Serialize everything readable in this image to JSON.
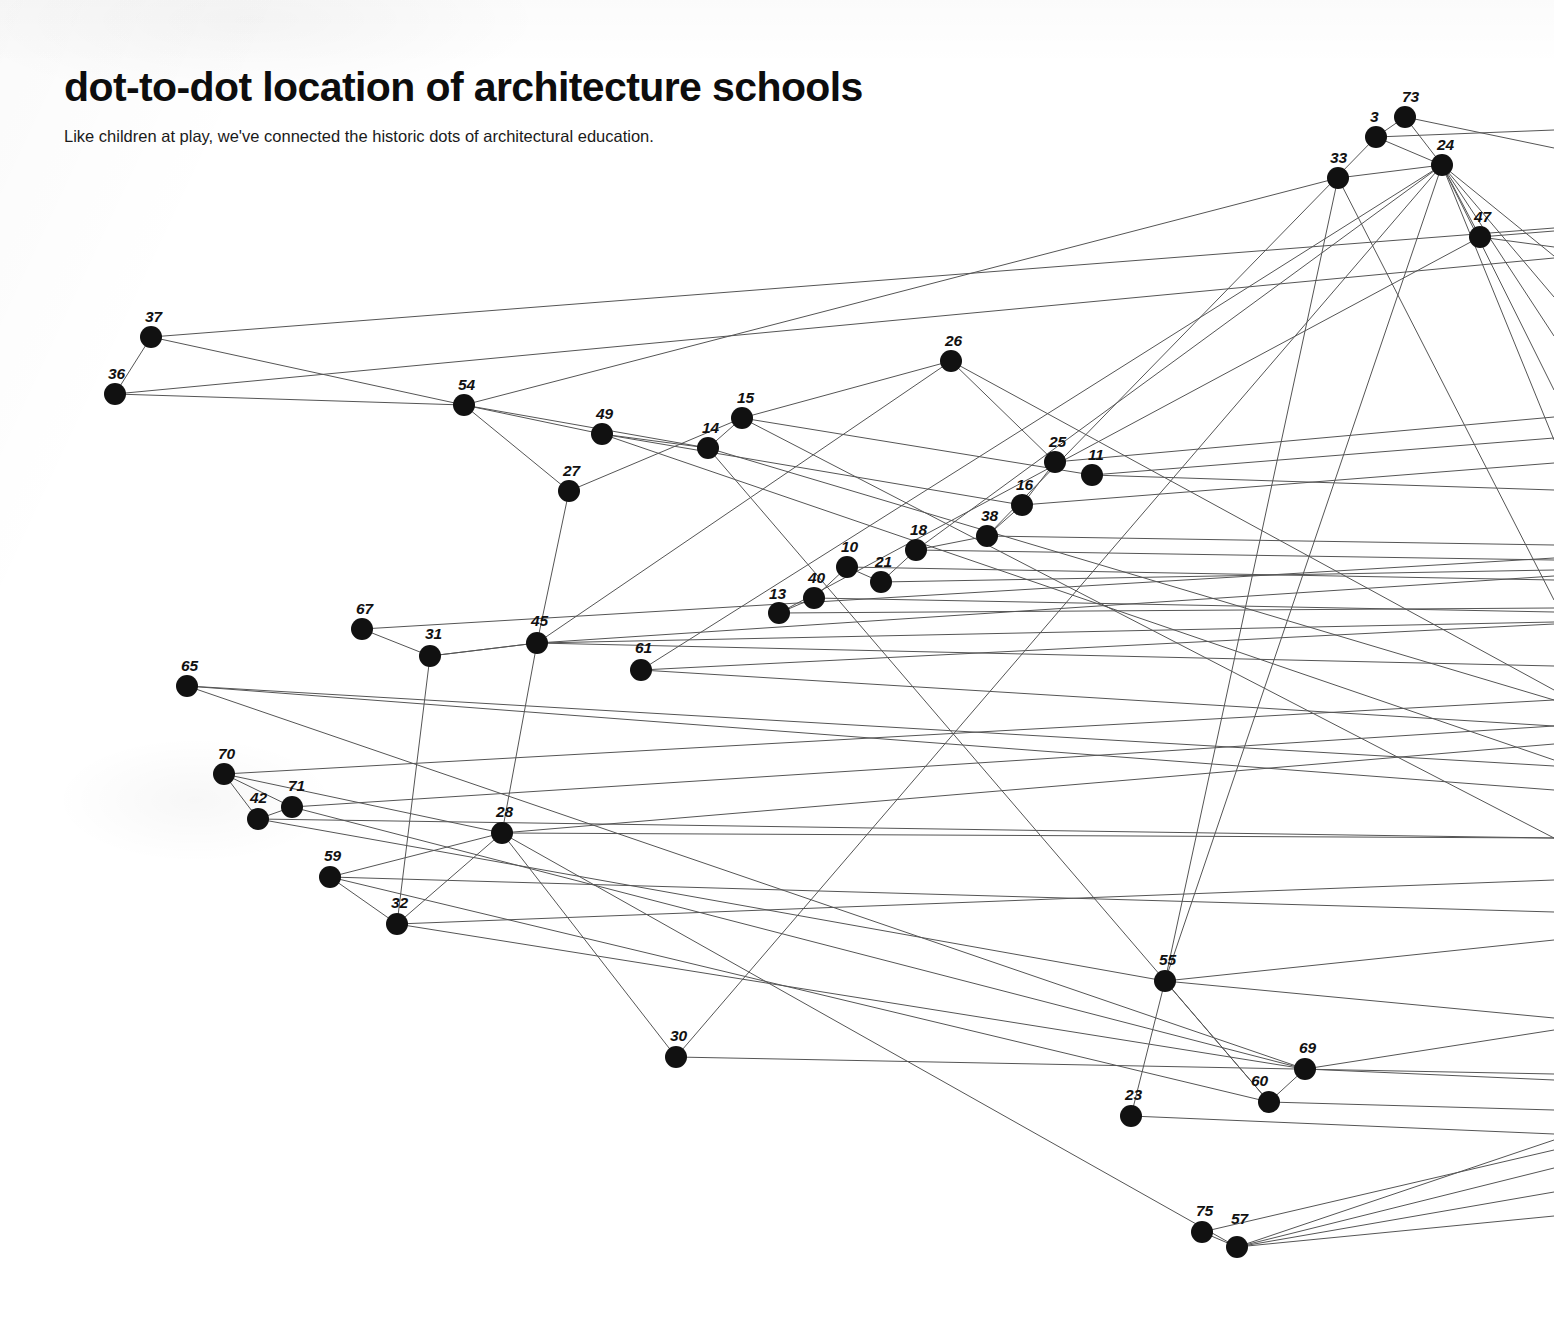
{
  "header": {
    "title": "dot-to-dot location of architecture schools",
    "subtitle": "Like children at play, we've connected the historic dots of architectural education."
  },
  "style": {
    "background": "#ffffff",
    "node_color": "#111111",
    "edge_color": "#555555",
    "text_color": "#0d0d0d",
    "node_radius": 11,
    "edge_width": 1
  },
  "chart_data": {
    "type": "scatter",
    "title": "dot-to-dot location of architecture schools",
    "subtitle": "Like children at play, we've connected the historic dots of architectural education.",
    "xlabel": "",
    "ylabel": "",
    "xlim": [
      0,
      1554
    ],
    "ylim": [
      0,
      1322
    ],
    "grid": false,
    "legend": null,
    "note": "Node-link diagram on a scanned page; numbered dots connected by thin straight lines, many of which continue past the right page edge.",
    "nodes": [
      {
        "id": "3",
        "x": 1376,
        "y": 137,
        "label_dx": -6,
        "label_dy": -20
      },
      {
        "id": "73",
        "x": 1405,
        "y": 117,
        "label_dx": -3,
        "label_dy": -20
      },
      {
        "id": "24",
        "x": 1442,
        "y": 165,
        "label_dx": -5,
        "label_dy": -20
      },
      {
        "id": "33",
        "x": 1338,
        "y": 178,
        "label_dx": -8,
        "label_dy": -20
      },
      {
        "id": "47",
        "x": 1480,
        "y": 237,
        "label_dx": -6,
        "label_dy": -20
      },
      {
        "id": "37",
        "x": 151,
        "y": 337,
        "label_dx": -6,
        "label_dy": -20
      },
      {
        "id": "36",
        "x": 115,
        "y": 394,
        "label_dx": -7,
        "label_dy": -20
      },
      {
        "id": "26",
        "x": 951,
        "y": 361,
        "label_dx": -6,
        "label_dy": -20
      },
      {
        "id": "54",
        "x": 464,
        "y": 405,
        "label_dx": -6,
        "label_dy": -20
      },
      {
        "id": "49",
        "x": 602,
        "y": 434,
        "label_dx": -6,
        "label_dy": -20
      },
      {
        "id": "15",
        "x": 742,
        "y": 418,
        "label_dx": -5,
        "label_dy": -20
      },
      {
        "id": "14",
        "x": 708,
        "y": 448,
        "label_dx": -6,
        "label_dy": -20
      },
      {
        "id": "25",
        "x": 1055,
        "y": 462,
        "label_dx": -6,
        "label_dy": -20
      },
      {
        "id": "11",
        "x": 1092,
        "y": 475,
        "label_dx": -4,
        "label_dy": -20
      },
      {
        "id": "27",
        "x": 569,
        "y": 491,
        "label_dx": -6,
        "label_dy": -20
      },
      {
        "id": "16",
        "x": 1022,
        "y": 505,
        "label_dx": -6,
        "label_dy": -20
      },
      {
        "id": "38",
        "x": 987,
        "y": 536,
        "label_dx": -6,
        "label_dy": -20
      },
      {
        "id": "18",
        "x": 916,
        "y": 550,
        "label_dx": -6,
        "label_dy": -20
      },
      {
        "id": "10",
        "x": 847,
        "y": 567,
        "label_dx": -6,
        "label_dy": -20
      },
      {
        "id": "21",
        "x": 881,
        "y": 582,
        "label_dx": -6,
        "label_dy": -20
      },
      {
        "id": "40",
        "x": 814,
        "y": 598,
        "label_dx": -6,
        "label_dy": -20
      },
      {
        "id": "13",
        "x": 779,
        "y": 613,
        "label_dx": -10,
        "label_dy": -19
      },
      {
        "id": "67",
        "x": 362,
        "y": 629,
        "label_dx": -6,
        "label_dy": -20
      },
      {
        "id": "45",
        "x": 537,
        "y": 643,
        "label_dx": -6,
        "label_dy": -22
      },
      {
        "id": "31",
        "x": 430,
        "y": 656,
        "label_dx": -5,
        "label_dy": -22
      },
      {
        "id": "61",
        "x": 641,
        "y": 670,
        "label_dx": -6,
        "label_dy": -22
      },
      {
        "id": "65",
        "x": 187,
        "y": 686,
        "label_dx": -6,
        "label_dy": -20
      },
      {
        "id": "70",
        "x": 224,
        "y": 774,
        "label_dx": -6,
        "label_dy": -20
      },
      {
        "id": "71",
        "x": 292,
        "y": 807,
        "label_dx": -4,
        "label_dy": -21
      },
      {
        "id": "42",
        "x": 258,
        "y": 819,
        "label_dx": -8,
        "label_dy": -21
      },
      {
        "id": "28",
        "x": 502,
        "y": 833,
        "label_dx": -6,
        "label_dy": -21
      },
      {
        "id": "59",
        "x": 330,
        "y": 877,
        "label_dx": -6,
        "label_dy": -21
      },
      {
        "id": "32",
        "x": 397,
        "y": 924,
        "label_dx": -6,
        "label_dy": -21
      },
      {
        "id": "55",
        "x": 1165,
        "y": 981,
        "label_dx": -6,
        "label_dy": -21
      },
      {
        "id": "30",
        "x": 676,
        "y": 1057,
        "label_dx": -6,
        "label_dy": -21
      },
      {
        "id": "69",
        "x": 1305,
        "y": 1069,
        "label_dx": -6,
        "label_dy": -21
      },
      {
        "id": "60",
        "x": 1269,
        "y": 1102,
        "label_dx": -18,
        "label_dy": -21
      },
      {
        "id": "23",
        "x": 1131,
        "y": 1116,
        "label_dx": -6,
        "label_dy": -21
      },
      {
        "id": "75",
        "x": 1202,
        "y": 1232,
        "label_dx": -6,
        "label_dy": -21
      },
      {
        "id": "57",
        "x": 1237,
        "y": 1247,
        "label_dx": -6,
        "label_dy": -28
      }
    ],
    "edges": [
      [
        "37",
        "36"
      ],
      [
        "37",
        "54"
      ],
      [
        "36",
        "54"
      ],
      [
        "3",
        "24"
      ],
      [
        "73",
        "24"
      ],
      [
        "3",
        "73"
      ],
      [
        "33",
        "24"
      ],
      [
        "24",
        "47"
      ],
      [
        "26",
        "25"
      ],
      [
        "26",
        "15"
      ],
      [
        "54",
        "49"
      ],
      [
        "54",
        "27"
      ],
      [
        "54",
        "14"
      ],
      [
        "49",
        "14"
      ],
      [
        "15",
        "14"
      ],
      [
        "27",
        "45"
      ],
      [
        "25",
        "16"
      ],
      [
        "16",
        "38"
      ],
      [
        "38",
        "18"
      ],
      [
        "18",
        "21"
      ],
      [
        "10",
        "21"
      ],
      [
        "10",
        "40"
      ],
      [
        "40",
        "13"
      ],
      [
        "67",
        "31"
      ],
      [
        "31",
        "45"
      ],
      [
        "31",
        "32"
      ],
      [
        "45",
        "28"
      ],
      [
        "70",
        "71"
      ],
      [
        "70",
        "42"
      ],
      [
        "71",
        "42"
      ],
      [
        "59",
        "32"
      ],
      [
        "59",
        "28"
      ],
      [
        "32",
        "28"
      ],
      [
        "28",
        "30"
      ],
      [
        "55",
        "60"
      ],
      [
        "60",
        "69"
      ],
      [
        "23",
        "55"
      ],
      [
        "75",
        "57"
      ]
    ],
    "open_edges": [
      {
        "from": "37",
        "to_x": 1554,
        "to_y": 228
      },
      {
        "from": "36",
        "to_x": 1554,
        "to_y": 258
      },
      {
        "from": "3",
        "to_x": 1554,
        "to_y": 130
      },
      {
        "from": "73",
        "to_x": 1554,
        "to_y": 148
      },
      {
        "from": "24",
        "to_x": 1554,
        "to_y": 256
      },
      {
        "from": "24",
        "to_x": 1554,
        "to_y": 297
      },
      {
        "from": "24",
        "to_x": 1554,
        "to_y": 336
      },
      {
        "from": "24",
        "to_x": 1554,
        "to_y": 390
      },
      {
        "from": "24",
        "to_x": 1554,
        "to_y": 440
      },
      {
        "from": "47",
        "to_x": 1554,
        "to_y": 231
      },
      {
        "from": "47",
        "to_x": 1554,
        "to_y": 247
      },
      {
        "from": "33",
        "to_x": 1554,
        "to_y": 600
      },
      {
        "from": "26",
        "to_x": 1554,
        "to_y": 690
      },
      {
        "from": "25",
        "to_x": 1554,
        "to_y": 417
      },
      {
        "from": "11",
        "to_x": 1554,
        "to_y": 438
      },
      {
        "from": "11",
        "to_x": 1554,
        "to_y": 490
      },
      {
        "from": "16",
        "to_x": 1554,
        "to_y": 463
      },
      {
        "from": "38",
        "to_x": 1554,
        "to_y": 545
      },
      {
        "from": "18",
        "to_x": 1554,
        "to_y": 560
      },
      {
        "from": "21",
        "to_x": 1554,
        "to_y": 570
      },
      {
        "from": "10",
        "to_x": 1554,
        "to_y": 580
      },
      {
        "from": "13",
        "to_x": 1554,
        "to_y": 608
      },
      {
        "from": "40",
        "to_x": 1554,
        "to_y": 612
      },
      {
        "from": "67",
        "to_x": 1554,
        "to_y": 558
      },
      {
        "from": "45",
        "to_x": 1554,
        "to_y": 576
      },
      {
        "from": "45",
        "to_x": 1554,
        "to_y": 622
      },
      {
        "from": "45",
        "to_x": 1554,
        "to_y": 666
      },
      {
        "from": "61",
        "to_x": 1554,
        "to_y": 624
      },
      {
        "from": "61",
        "to_x": 1554,
        "to_y": 726
      },
      {
        "from": "65",
        "to_x": 1554,
        "to_y": 766
      },
      {
        "from": "65",
        "to_x": 1554,
        "to_y": 790
      },
      {
        "from": "70",
        "to_x": 1554,
        "to_y": 700
      },
      {
        "from": "71",
        "to_x": 1554,
        "to_y": 726
      },
      {
        "from": "42",
        "to_x": 1554,
        "to_y": 838
      },
      {
        "from": "28",
        "to_x": 1554,
        "to_y": 744
      },
      {
        "from": "28",
        "to_x": 1554,
        "to_y": 838
      },
      {
        "from": "59",
        "to_x": 1554,
        "to_y": 912
      },
      {
        "from": "32",
        "to_x": 1554,
        "to_y": 880
      },
      {
        "from": "55",
        "to_x": 1554,
        "to_y": 940
      },
      {
        "from": "55",
        "to_x": 1554,
        "to_y": 1018
      },
      {
        "from": "30",
        "to_x": 1554,
        "to_y": 1074
      },
      {
        "from": "69",
        "to_x": 1554,
        "to_y": 1030
      },
      {
        "from": "69",
        "to_x": 1554,
        "to_y": 1080
      },
      {
        "from": "60",
        "to_x": 1554,
        "to_y": 1110
      },
      {
        "from": "23",
        "to_x": 1554,
        "to_y": 1134
      },
      {
        "from": "57",
        "to_x": 1554,
        "to_y": 1140
      },
      {
        "from": "57",
        "to_x": 1554,
        "to_y": 1168
      },
      {
        "from": "57",
        "to_x": 1554,
        "to_y": 1192
      },
      {
        "from": "57",
        "to_x": 1554,
        "to_y": 1216
      },
      {
        "from": "75",
        "to_x": 1554,
        "to_y": 1150
      },
      {
        "from": "14",
        "to_x": 1554,
        "to_y": 700
      },
      {
        "from": "49",
        "to_x": 1554,
        "to_y": 760
      },
      {
        "from": "15",
        "to_x": 1554,
        "to_y": 838
      }
    ],
    "cross_edges": [
      {
        "from": "54",
        "to_x": 1338,
        "to_y": 178
      },
      {
        "from": "33",
        "to_x": 1165,
        "to_y": 981
      },
      {
        "from": "24",
        "to_x": 1165,
        "to_y": 981
      },
      {
        "from": "24",
        "to_x": 676,
        "to_y": 1057
      },
      {
        "from": "14",
        "to_x": 1269,
        "to_y": 1102
      },
      {
        "from": "15",
        "to_x": 1092,
        "to_y": 475
      },
      {
        "from": "49",
        "to_x": 1022,
        "to_y": 505
      },
      {
        "from": "27",
        "to_x": 742,
        "to_y": 418
      },
      {
        "from": "45",
        "to_x": 951,
        "to_y": 361
      },
      {
        "from": "65",
        "to_x": 1305,
        "to_y": 1069
      },
      {
        "from": "42",
        "to_x": 1165,
        "to_y": 981
      },
      {
        "from": "71",
        "to_x": 1305,
        "to_y": 1069
      },
      {
        "from": "70",
        "to_x": 502,
        "to_y": 833
      },
      {
        "from": "31",
        "to_x": 537,
        "to_y": 643
      },
      {
        "from": "28",
        "to_x": 1237,
        "to_y": 1247
      },
      {
        "from": "61",
        "to_x": 1442,
        "to_y": 165
      },
      {
        "from": "59",
        "to_x": 1269,
        "to_y": 1102
      },
      {
        "from": "13",
        "to_x": 1480,
        "to_y": 237
      },
      {
        "from": "38",
        "to_x": 1376,
        "to_y": 137
      },
      {
        "from": "18",
        "to_x": 1442,
        "to_y": 165
      },
      {
        "from": "32",
        "to_x": 1305,
        "to_y": 1069
      }
    ]
  }
}
